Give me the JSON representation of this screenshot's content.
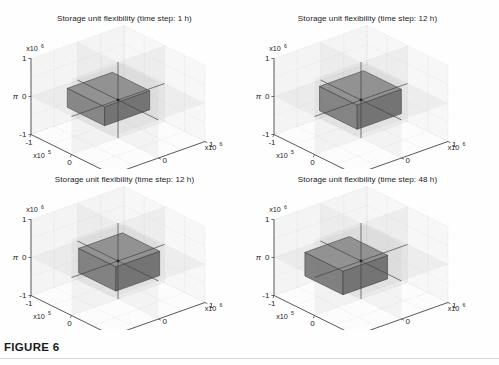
{
  "figure": {
    "caption": "FIGURE 6",
    "background": "#fefefe"
  },
  "chart_data": [
    {
      "type": "bar",
      "title": "Storage unit flexibility (time step: 1 h)",
      "xlabel": "ρ",
      "ylabel": "ε",
      "zlabel": "π",
      "xticks": [
        "-1",
        "0",
        "1"
      ],
      "yticks": [
        "-1",
        "0",
        "1"
      ],
      "zticks": [
        "-1",
        "0",
        "1"
      ],
      "xlim": [
        -1,
        1
      ],
      "ylim": [
        -1,
        1
      ],
      "zlim": [
        -1,
        1
      ],
      "x_exponent": "x10",
      "x_exponent_sup": "5",
      "y_exponent": "x10",
      "y_exponent_sup": "6",
      "z_exponent": "x10",
      "z_exponent_sup": "6",
      "grid": true,
      "legend": "none",
      "box_color": "#808080",
      "box": {
        "x0": -0.62,
        "x1": 0.3,
        "y0": -0.55,
        "y1": 0.42,
        "z0": -0.28,
        "z1": 0.22
      },
      "annotation": "flat wide cuboid centred near origin, thin in π"
    },
    {
      "type": "bar",
      "title": "Storage unit flexibility (time step: 12 h)",
      "xlabel": "ρ",
      "ylabel": "ε",
      "zlabel": "π",
      "xticks": [
        "-1",
        "0",
        "1"
      ],
      "yticks": [
        "-1",
        "0",
        "1"
      ],
      "zticks": [
        "-1",
        "0",
        "1"
      ],
      "xlim": [
        -1,
        1
      ],
      "ylim": [
        -1,
        1
      ],
      "zlim": [
        -1,
        1
      ],
      "x_exponent": "x10",
      "x_exponent_sup": "5",
      "y_exponent": "x10",
      "y_exponent_sup": "6",
      "z_exponent": "x10",
      "z_exponent_sup": "6",
      "grid": true,
      "legend": "none",
      "box_color": "#7d7d7d",
      "box": {
        "x0": -0.45,
        "x1": 0.48,
        "y0": -0.5,
        "y1": 0.45,
        "z0": -0.3,
        "z1": 0.34
      },
      "annotation": "taller cuboid, shifted slightly right and up"
    },
    {
      "type": "bar",
      "title": "Storage unit flexibility (time step: 12 h)",
      "xlabel": "ρ",
      "ylabel": "ε",
      "zlabel": "π",
      "xticks": [
        "-1",
        "0",
        "1"
      ],
      "yticks": [
        "-1",
        "0",
        "1"
      ],
      "zticks": [
        "-1",
        "0",
        "1"
      ],
      "xlim": [
        -1,
        1
      ],
      "ylim": [
        -1,
        1
      ],
      "zlim": [
        -1,
        1
      ],
      "x_exponent": "x10",
      "x_exponent_sup": "5",
      "y_exponent": "x10",
      "y_exponent_sup": "6",
      "z_exponent": "x10",
      "z_exponent_sup": "6",
      "grid": true,
      "legend": "none",
      "box_color": "#7b7b7b",
      "box": {
        "x0": -0.42,
        "x1": 0.5,
        "y0": -0.48,
        "y1": 0.46,
        "z0": -0.32,
        "z1": 0.32
      },
      "annotation": "cuboid similar to panel 2, centred"
    },
    {
      "type": "bar",
      "title": "Storage unit flexibility (time step: 48 h)",
      "xlabel": "ρ",
      "ylabel": "ε",
      "zlabel": "π",
      "xticks": [
        "-1",
        "0",
        "1"
      ],
      "yticks": [
        "-1",
        "0",
        "1"
      ],
      "zticks": [
        "-1",
        "0",
        "1"
      ],
      "xlim": [
        -1,
        1
      ],
      "ylim": [
        -1,
        1
      ],
      "zlim": [
        -1,
        1
      ],
      "x_exponent": "x10",
      "x_exponent_sup": "5",
      "y_exponent": "x10",
      "y_exponent_sup": "6",
      "z_exponent": "x10",
      "z_exponent_sup": "6",
      "grid": true,
      "legend": "none",
      "box_color": "#797979",
      "box": {
        "x0": -0.72,
        "x1": 0.22,
        "y0": -0.58,
        "y1": 0.38,
        "z0": -0.52,
        "z1": 0.1
      },
      "annotation": "cuboid shifted left and downward in π"
    }
  ]
}
